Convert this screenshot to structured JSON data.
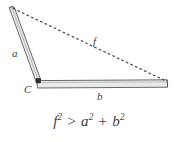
{
  "figure": {
    "type": "geometry-diagram",
    "background_color": "#ffffff",
    "rod_fill_color": "#e9e9e9",
    "rod_stroke_color": "#585858",
    "dashed_line_color": "#4a4a4a",
    "text_color": "#3b3b3b"
  },
  "labels": {
    "side_a": "a",
    "side_b": "b",
    "side_f": "f",
    "vertex_c": "C"
  },
  "formula": {
    "lhs_base": "f",
    "lhs_exp": "2",
    "operator": ">",
    "term1_base": "a",
    "term1_exp": "2",
    "plus": "+",
    "term2_base": "b",
    "term2_exp": "2",
    "full_text": "f2 > a2 + b2"
  },
  "geometry": {
    "vertex_top": [
      11,
      8
    ],
    "vertex_corner": [
      38,
      81
    ],
    "vertex_right": [
      167,
      84
    ],
    "rod_a_length_label": "a",
    "rod_b_length_label": "b",
    "dashed_side_label": "f",
    "angle_marker_at": "C",
    "angle_marker_type": "obtuse-square-marker"
  }
}
